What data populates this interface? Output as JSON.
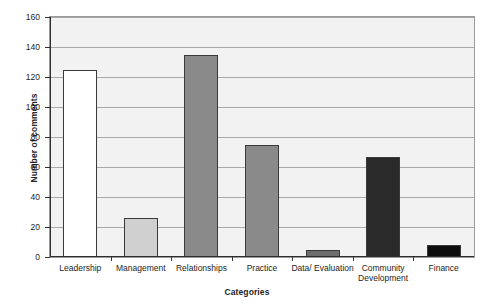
{
  "chart_data": {
    "type": "bar",
    "title": "",
    "xlabel": "Categories",
    "ylabel": "Number of comments",
    "categories": [
      "Leadership",
      "Management",
      "Relationships",
      "Practice",
      "Data/ Evaluation",
      "Community\nDevelopment",
      "Finance"
    ],
    "values": [
      125,
      26,
      135,
      75,
      5,
      67,
      8
    ],
    "ylim": [
      0,
      160
    ],
    "ytick_values": [
      0,
      20,
      40,
      60,
      80,
      100,
      120,
      140,
      160
    ],
    "ytick_labels": [
      "0",
      "20",
      "40",
      "60",
      "80",
      "100",
      "120",
      "140",
      "160"
    ],
    "grid": true,
    "legend": "none",
    "bar_colors": [
      "#ffffff",
      "#d0d0d0",
      "#8a8a8a",
      "#8a8a8a",
      "#6e6e6e",
      "#2a2a2a",
      "#0d0d0d"
    ],
    "bar_border_color": "#3a3a3a",
    "plot_background": "#f2f2f2",
    "gridline_color": "#a8a8a8",
    "axis_color": "#2e2e2e"
  }
}
